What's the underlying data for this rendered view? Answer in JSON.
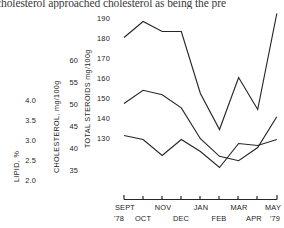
{
  "page": {
    "running_text": "cholesterol approached cholesterol as being the pre"
  },
  "figure": {
    "ink_color": "#262626"
  },
  "axes": {
    "lipid": {
      "title": "LIPID, %",
      "ticks": [
        "4.0",
        "3.5",
        "3.0",
        "2.5",
        "2.0"
      ]
    },
    "cholesterol": {
      "title": "CHOLESTEROL, mg/100g",
      "ticks": [
        "60",
        "55",
        "50",
        "45",
        "40",
        "35"
      ]
    },
    "steroids": {
      "title": "TOTAL STEROIDS mg/100g",
      "ticks": [
        "190",
        "180",
        "170",
        "160",
        "150",
        "140",
        "130"
      ]
    },
    "x": {
      "top_row": [
        "SEPT",
        "NOV",
        "JAN",
        "MAR",
        "MAY"
      ],
      "bottom_row": [
        "'78",
        "OCT",
        "DEC",
        "FEB",
        "APR",
        "'79"
      ]
    }
  },
  "chart_data": {
    "type": "line",
    "title": "",
    "xlabel": "",
    "ylabel": "",
    "grid": false,
    "legend": "none",
    "x": [
      "SEPT '78",
      "OCT",
      "NOV",
      "DEC",
      "JAN",
      "FEB",
      "MAR",
      "APR",
      "MAY '79"
    ],
    "series": [
      {
        "name": "Total Steroids",
        "unit": "mg/100g",
        "axis": "steroids",
        "ylim": [
          130,
          190
        ],
        "values": [
          180,
          188,
          183,
          183,
          152,
          134,
          160,
          144,
          192
        ]
      },
      {
        "name": "Cholesterol",
        "unit": "mg/100g",
        "axis": "cholesterol",
        "ylim": [
          35,
          60
        ],
        "values": [
          50,
          53,
          52,
          49,
          42,
          38,
          37,
          40,
          47
        ]
      },
      {
        "name": "Lipid",
        "unit": "%",
        "axis": "lipid",
        "ylim": [
          2.0,
          4.0
        ],
        "values": [
          3.1,
          3.0,
          2.6,
          3.0,
          2.7,
          2.3,
          2.9,
          2.85,
          3.0
        ]
      }
    ]
  }
}
